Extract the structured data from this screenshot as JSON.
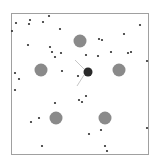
{
  "arena": {
    "border": {
      "x": 11,
      "y": 13,
      "w": 137,
      "h": 141,
      "color": "#a0a0a0"
    },
    "background": "#ffffff"
  },
  "agent": {
    "x": 88,
    "y": 72,
    "r": 4.5,
    "color": "#2a2a2a",
    "sensors": [
      {
        "x1": 84,
        "y1": 69,
        "x2": 75,
        "y2": 60
      },
      {
        "x1": 84,
        "y1": 75,
        "x2": 77,
        "y2": 86
      }
    ],
    "sensor_color": "#b8b8b8"
  },
  "obstacles": {
    "color": "#8a8a8a",
    "items": [
      {
        "x": 80,
        "y": 41,
        "r": 6.5
      },
      {
        "x": 41,
        "y": 70,
        "r": 6.5
      },
      {
        "x": 119,
        "y": 70,
        "r": 6.5
      },
      {
        "x": 56,
        "y": 118,
        "r": 6.5
      },
      {
        "x": 105,
        "y": 118,
        "r": 6.5
      }
    ]
  },
  "food": {
    "color": "#2e2e2e",
    "r": 1.1,
    "items": [
      [
        49,
        16
      ],
      [
        30,
        20
      ],
      [
        16,
        23
      ],
      [
        43,
        22
      ],
      [
        29,
        24
      ],
      [
        12,
        31
      ],
      [
        60,
        29
      ],
      [
        140,
        25
      ],
      [
        124,
        34
      ],
      [
        28,
        45
      ],
      [
        50,
        47
      ],
      [
        99,
        39
      ],
      [
        102,
        40
      ],
      [
        52,
        52
      ],
      [
        61,
        53
      ],
      [
        55,
        57
      ],
      [
        86,
        55
      ],
      [
        98,
        56
      ],
      [
        111,
        52
      ],
      [
        128,
        53
      ],
      [
        131,
        52
      ],
      [
        147,
        61
      ],
      [
        62,
        71
      ],
      [
        15,
        73
      ],
      [
        19,
        79
      ],
      [
        78,
        76
      ],
      [
        15,
        90
      ],
      [
        86,
        96
      ],
      [
        55,
        103
      ],
      [
        79,
        100
      ],
      [
        82,
        102
      ],
      [
        39,
        118
      ],
      [
        31,
        122
      ],
      [
        89,
        134
      ],
      [
        101,
        130
      ],
      [
        147,
        128
      ],
      [
        42,
        146
      ],
      [
        105,
        146
      ],
      [
        107,
        151
      ]
    ]
  }
}
